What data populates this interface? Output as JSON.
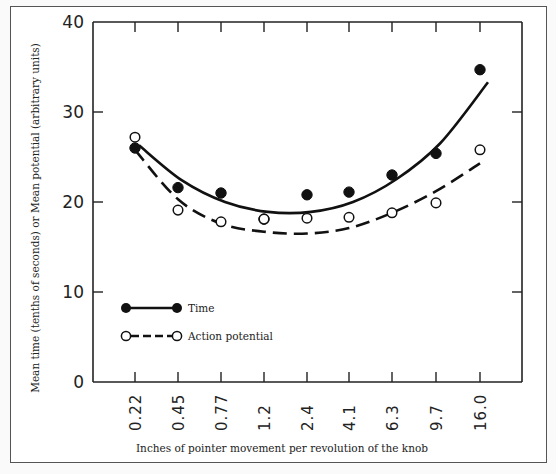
{
  "chart_data": {
    "type": "scatter",
    "title": "",
    "xlabel": "Inches of pointer movement per revolution of the knob",
    "ylabel": "Mean time (tenths of seconds) or Mean potential (arbitrary units)",
    "categories": [
      "0.22",
      "0.45",
      "0.77",
      "1.2",
      "2.4",
      "4.1",
      "6.3",
      "9.7",
      "16.0"
    ],
    "ylim": [
      0,
      40
    ],
    "yticks": [
      "0",
      "10",
      "20",
      "30",
      "40"
    ],
    "grid": false,
    "legend_position": "lower left inside",
    "series": [
      {
        "name": "Time",
        "marker": "filled-circle",
        "line": "solid",
        "values": [
          26.0,
          21.6,
          21.0,
          18.1,
          20.8,
          21.1,
          23.0,
          25.4,
          34.7
        ],
        "fit_curve": [
          26.3,
          22.4,
          20.0,
          18.9,
          18.9,
          20.0,
          22.5,
          26.5,
          33.3
        ]
      },
      {
        "name": "Action potential",
        "marker": "open-circle",
        "line": "dashed",
        "values": [
          27.2,
          19.1,
          17.8,
          18.1,
          18.2,
          18.3,
          18.8,
          19.9,
          25.8
        ],
        "fit_curve": [
          25.8,
          20.3,
          17.6,
          16.7,
          16.5,
          17.1,
          18.8,
          21.2,
          24.3
        ]
      }
    ]
  },
  "axes": {
    "y_ticks": [
      "40",
      "30",
      "20",
      "10",
      "0"
    ],
    "x_ticks": [
      "0.22",
      "0.45",
      "0.77",
      "1.2",
      "2.4",
      "4.1",
      "6.3",
      "9.7",
      "16.0"
    ],
    "xlabel": "Inches of pointer movement per revolution of the knob",
    "ylabel": "Mean time (tenths of seconds) or Mean potential (arbitrary units)"
  },
  "legend": {
    "time_label": "Time",
    "action_label": "Action potential"
  }
}
